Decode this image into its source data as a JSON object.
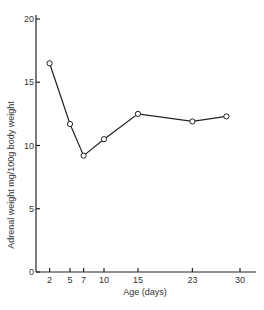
{
  "chart_data": {
    "type": "line",
    "title": "",
    "xlabel": "Age (days)",
    "ylabel": "Adrenal weight mg/100g body weight",
    "xlim": [
      0,
      32
    ],
    "ylim": [
      0,
      20
    ],
    "x_ticks": [
      2,
      5,
      7,
      10,
      15,
      23,
      30
    ],
    "y_ticks": [
      0,
      5,
      10,
      15,
      20
    ],
    "grid": false,
    "legend": null,
    "series": [
      {
        "name": "Adrenal weight",
        "marker": "open-circle",
        "x": [
          2,
          5,
          7,
          10,
          15,
          23,
          28
        ],
        "y": [
          16.5,
          11.7,
          9.2,
          10.5,
          12.5,
          11.9,
          12.3
        ]
      }
    ]
  }
}
